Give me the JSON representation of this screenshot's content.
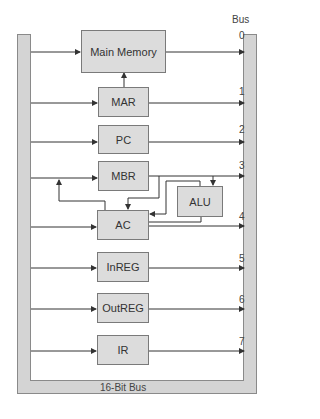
{
  "diagram": {
    "bus_label": "Bus",
    "bus_caption": "16-Bit Bus",
    "components": [
      {
        "id": "main-memory",
        "label": "Main Memory",
        "bus_line": "0"
      },
      {
        "id": "mar",
        "label": "MAR",
        "bus_line": "1"
      },
      {
        "id": "pc",
        "label": "PC",
        "bus_line": "2"
      },
      {
        "id": "mbr",
        "label": "MBR",
        "bus_line": "3"
      },
      {
        "id": "alu",
        "label": "ALU",
        "bus_line": ""
      },
      {
        "id": "ac",
        "label": "AC",
        "bus_line": "4"
      },
      {
        "id": "inreg",
        "label": "InREG",
        "bus_line": "5"
      },
      {
        "id": "outreg",
        "label": "OutREG",
        "bus_line": "6"
      },
      {
        "id": "ir",
        "label": "IR",
        "bus_line": "7"
      }
    ],
    "colors": {
      "bus_fill": "#d4d4d4",
      "box_fill": "#dcdcdc",
      "line": "#333333"
    }
  }
}
